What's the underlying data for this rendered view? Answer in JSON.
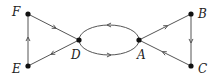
{
  "diagram": {
    "type": "directed-graph",
    "colors": {
      "edge": "#555555",
      "node": "#111111",
      "label": "#222222",
      "background": "#ffffff"
    },
    "nodes": [
      {
        "id": "F",
        "label": "F",
        "x": 28,
        "y": 14,
        "label_x": 12,
        "label_y": 6
      },
      {
        "id": "E",
        "label": "E",
        "x": 28,
        "y": 66,
        "label_x": 12,
        "label_y": 63
      },
      {
        "id": "D",
        "label": "D",
        "x": 79,
        "y": 40,
        "label_x": 71,
        "label_y": 49
      },
      {
        "id": "A",
        "label": "A",
        "x": 139,
        "y": 40,
        "label_x": 137,
        "label_y": 49
      },
      {
        "id": "B",
        "label": "B",
        "x": 191,
        "y": 14,
        "label_x": 198,
        "label_y": 8
      },
      {
        "id": "C",
        "label": "C",
        "x": 191,
        "y": 66,
        "label_x": 198,
        "label_y": 63
      }
    ],
    "edges": [
      {
        "from": "F",
        "to": "D",
        "shape": "line"
      },
      {
        "from": "D",
        "to": "E",
        "shape": "line"
      },
      {
        "from": "E",
        "to": "F",
        "shape": "line"
      },
      {
        "from": "A",
        "to": "D",
        "shape": "arc-upper"
      },
      {
        "from": "D",
        "to": "A",
        "shape": "arc-lower"
      },
      {
        "from": "A",
        "to": "B",
        "shape": "line"
      },
      {
        "from": "B",
        "to": "C",
        "shape": "line"
      },
      {
        "from": "C",
        "to": "A",
        "shape": "line"
      }
    ]
  }
}
